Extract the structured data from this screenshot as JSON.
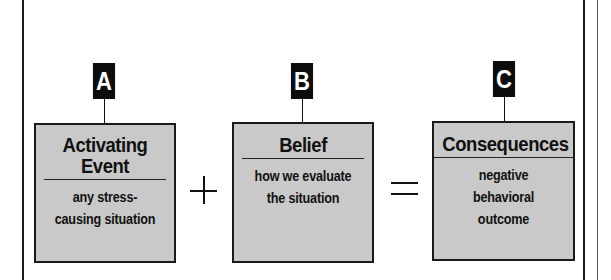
{
  "diagram": {
    "nodes": [
      {
        "tag": "A",
        "title": "Activating Event",
        "title_lines": [
          "Activating",
          "Event"
        ],
        "description": "any stress-causing situation",
        "description_lines": [
          "any stress-",
          "causing situation"
        ]
      },
      {
        "tag": "B",
        "title": "Belief",
        "title_lines": [
          "Belief"
        ],
        "description": "how we evaluate the situation",
        "description_lines": [
          "how we evaluate",
          "the situation"
        ]
      },
      {
        "tag": "C",
        "title": "Consequences",
        "title_lines": [
          "Consequences"
        ],
        "description": "negative behavioral outcome",
        "description_lines": [
          "negative",
          "behavioral",
          "outcome"
        ]
      }
    ],
    "operators": [
      "+",
      "="
    ],
    "colors": {
      "box_fill": "#c9c9c9",
      "tag_fill": "#0d0d0d",
      "tag_text": "#ffffff",
      "line": "#1a1a1a"
    }
  }
}
